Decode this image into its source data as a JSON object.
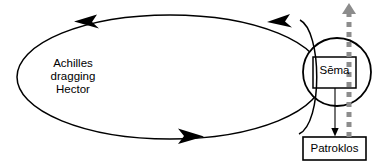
{
  "diagram": {
    "canvas": {
      "width": 382,
      "height": 168,
      "background": "#ffffff"
    },
    "colors": {
      "line": "#000000",
      "dashed_arrow": "#8c8c8c",
      "background": "#ffffff"
    },
    "labels": {
      "circuit": "Achilles\ndragging\nHector",
      "tomb": "Sēma",
      "grave_occupant": "Patroklos"
    },
    "shapes": [
      {
        "name": "circuit-ellipse",
        "type": "ellipse",
        "cx": 170,
        "cy": 77,
        "rx": 153,
        "ry": 62,
        "stroke": "#000000",
        "fill": "none",
        "direction": "counterclockwise"
      },
      {
        "name": "sema-circle",
        "type": "circle",
        "cx": 337,
        "cy": 72,
        "r": 34,
        "stroke": "#000000",
        "fill": "none"
      },
      {
        "name": "sema-box",
        "type": "rect",
        "x": 313,
        "y": 57,
        "width": 43,
        "height": 31,
        "stroke": "#000000",
        "fill": "none"
      },
      {
        "name": "patroklos-box",
        "type": "rect",
        "x": 303,
        "y": 137,
        "width": 63,
        "height": 23,
        "stroke": "#000000",
        "fill": "none"
      }
    ],
    "arrows": [
      {
        "name": "ellipse-arrow-top-left",
        "points": "left",
        "x": 88,
        "y": 21
      },
      {
        "name": "ellipse-arrow-top-right",
        "points": "left",
        "x": 281,
        "y": 20
      },
      {
        "name": "ellipse-arrow-bottom",
        "points": "right",
        "x": 188,
        "y": 136
      },
      {
        "name": "sema-to-patroklos-arrow",
        "points": "down",
        "x": 335,
        "y": 137
      },
      {
        "name": "ascent-dashed-arrow",
        "points": "up",
        "x": 349,
        "y": 8,
        "style": "dashed",
        "color": "#8c8c8c"
      }
    ]
  }
}
